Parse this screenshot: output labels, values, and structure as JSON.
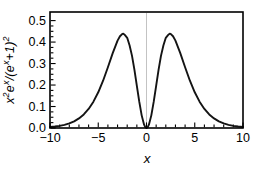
{
  "figure": {
    "background": "#ffffff",
    "frame_color": "#000000",
    "curve_color": "#141414",
    "zero_axis_color": "#b4b4b4",
    "tick_color": "#000000",
    "xlabel": "x",
    "ylabel": "x²eˣ/(eˣ+1)²",
    "ylabel_parts": [
      {
        "text": "x",
        "sup": "2"
      },
      {
        "text": "e",
        "sup": "x"
      },
      {
        "text": "/(",
        "sup": ""
      },
      {
        "text": "e",
        "sup": "x"
      },
      {
        "text": "+1)",
        "sup": "2"
      }
    ]
  },
  "chart_data": {
    "type": "line",
    "title": "",
    "xlabel": "x",
    "ylabel": "x^2 e^x / (e^x + 1)^2",
    "xlim": [
      -10,
      10
    ],
    "ylim": [
      0,
      0.54
    ],
    "grid": false,
    "legend": null,
    "frame": true,
    "zero_axis_line_x": 0,
    "xticks": {
      "major": [
        -10,
        -5,
        0,
        5,
        10
      ],
      "labels": [
        "−10",
        "−5",
        "0",
        "5",
        "10"
      ],
      "minor_step": 1
    },
    "yticks": {
      "major": [
        0,
        0.1,
        0.2,
        0.3,
        0.4,
        0.5
      ],
      "labels": [
        "0.0",
        "0.1",
        "0.2",
        "0.3",
        "0.4",
        "0.5"
      ],
      "minor_step": 0.025
    },
    "series": [
      {
        "name": "x^2 e^x / (e^x + 1)^2",
        "peak": {
          "x": 2.4,
          "y": 0.4392
        },
        "points": [
          [
            -10,
            0.0045
          ],
          [
            -9.5,
            0.0068
          ],
          [
            -9,
            0.01
          ],
          [
            -8.5,
            0.0147
          ],
          [
            -8,
            0.0215
          ],
          [
            -7.5,
            0.0311
          ],
          [
            -7,
            0.0446
          ],
          [
            -6.5,
            0.0633
          ],
          [
            -6,
            0.0888
          ],
          [
            -5.5,
            0.1226
          ],
          [
            -5,
            0.1662
          ],
          [
            -4.5,
            0.22
          ],
          [
            -4,
            0.2826
          ],
          [
            -3.5,
            0.3486
          ],
          [
            -3,
            0.4066
          ],
          [
            -2.75,
            0.4271
          ],
          [
            -2.5,
            0.4382
          ],
          [
            -2.4,
            0.4392
          ],
          [
            -2.25,
            0.4336
          ],
          [
            -2,
            0.42
          ],
          [
            -1.75,
            0.3844
          ],
          [
            -1.5,
            0.3356
          ],
          [
            -1.25,
            0.271
          ],
          [
            -1,
            0.1966
          ],
          [
            -0.75,
            0.1226
          ],
          [
            -0.5,
            0.0588
          ],
          [
            -0.25,
            0.0154
          ],
          [
            -0.125,
            0.0039
          ],
          [
            0,
            0
          ],
          [
            0.125,
            0.0039
          ],
          [
            0.25,
            0.0154
          ],
          [
            0.5,
            0.0588
          ],
          [
            0.75,
            0.1226
          ],
          [
            1,
            0.1966
          ],
          [
            1.25,
            0.271
          ],
          [
            1.5,
            0.3356
          ],
          [
            1.75,
            0.3844
          ],
          [
            2,
            0.42
          ],
          [
            2.25,
            0.4336
          ],
          [
            2.4,
            0.4392
          ],
          [
            2.5,
            0.4382
          ],
          [
            2.75,
            0.4271
          ],
          [
            3,
            0.4066
          ],
          [
            3.5,
            0.3486
          ],
          [
            4,
            0.2826
          ],
          [
            4.5,
            0.22
          ],
          [
            5,
            0.1662
          ],
          [
            5.5,
            0.1226
          ],
          [
            6,
            0.0888
          ],
          [
            6.5,
            0.0633
          ],
          [
            7,
            0.0446
          ],
          [
            7.5,
            0.0311
          ],
          [
            8,
            0.0215
          ],
          [
            8.5,
            0.0147
          ],
          [
            9,
            0.01
          ],
          [
            9.5,
            0.0068
          ],
          [
            10,
            0.0045
          ]
        ]
      }
    ]
  }
}
